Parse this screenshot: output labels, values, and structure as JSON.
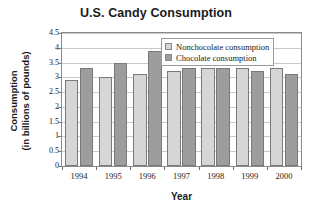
{
  "chart_data": {
    "type": "bar",
    "title": "U.S. Candy Consumption",
    "xlabel": "Year",
    "ylabel": "Consumption (in billions of pounds)",
    "ylabel_line1": "Consumption",
    "ylabel_line2": "(in billions of pounds)",
    "categories": [
      "1994",
      "1995",
      "1996",
      "1997",
      "1998",
      "1999",
      "2000"
    ],
    "series": [
      {
        "name": "Nonchocolate consumption",
        "color": "#d6d6d6",
        "values": [
          2.9,
          3.0,
          3.1,
          3.2,
          3.3,
          3.3,
          3.3
        ]
      },
      {
        "name": "Chocolate consumption",
        "color": "#9d9d9d",
        "values": [
          3.3,
          3.5,
          3.9,
          3.3,
          3.3,
          3.2,
          3.1
        ]
      }
    ],
    "ylim": [
      0,
      4.5
    ],
    "yticks": [
      "0",
      "0.5",
      "1",
      "1.5",
      "2",
      "2.5",
      "3",
      "3.5",
      "4",
      "4.5"
    ],
    "ytick_values": [
      0,
      0.5,
      1,
      1.5,
      2,
      2.5,
      3,
      3.5,
      4,
      4.5
    ],
    "grid": true,
    "legend_position": "top-right",
    "legend_entries": [
      {
        "label": "Nonchocolate consumption",
        "swatch": "light"
      },
      {
        "label": "Chocolate consumption",
        "swatch": "dark"
      }
    ]
  }
}
